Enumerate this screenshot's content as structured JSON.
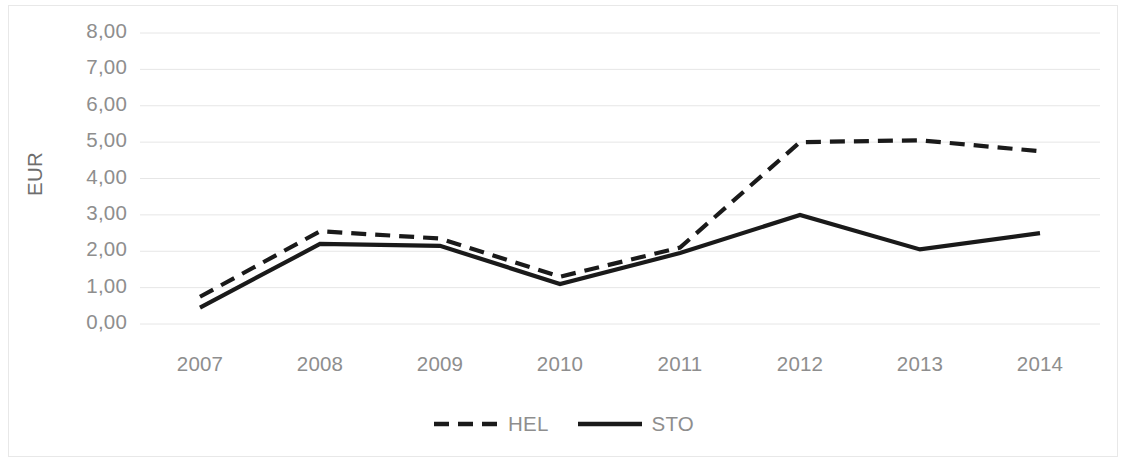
{
  "chart_data": {
    "type": "line",
    "title": "",
    "xlabel": "",
    "ylabel": "EUR",
    "categories": [
      "2007",
      "2008",
      "2009",
      "2010",
      "2011",
      "2012",
      "2013",
      "2014"
    ],
    "series": [
      {
        "name": "HEL",
        "style": "dashed",
        "color": "#1a1a1a",
        "values": [
          0.75,
          2.55,
          2.35,
          1.3,
          2.1,
          5.0,
          5.05,
          4.75
        ]
      },
      {
        "name": "STO",
        "style": "solid",
        "color": "#1a1a1a",
        "values": [
          0.45,
          2.2,
          2.15,
          1.1,
          1.95,
          3.0,
          2.05,
          2.5
        ]
      }
    ],
    "ylim": [
      0,
      8
    ],
    "ytick_labels": [
      "8,00",
      "7,00",
      "6,00",
      "5,00",
      "4,00",
      "3,00",
      "2,00",
      "1,00",
      "0,00"
    ],
    "ytick_values": [
      8,
      7,
      6,
      5,
      4,
      3,
      2,
      1,
      0
    ],
    "grid": true,
    "grid_color": "#e6e6e6",
    "legend_position": "bottom",
    "axis_label_color": "#8e8e8e",
    "background": "#ffffff"
  },
  "legend": {
    "items": [
      {
        "label": "HEL"
      },
      {
        "label": "STO"
      }
    ]
  }
}
